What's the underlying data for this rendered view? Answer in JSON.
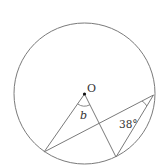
{
  "diagram": {
    "center_label": "O",
    "angle_b_label": "b",
    "angle_given_label": "38°",
    "stroke_color": "#808080",
    "text_color": "#333333"
  }
}
